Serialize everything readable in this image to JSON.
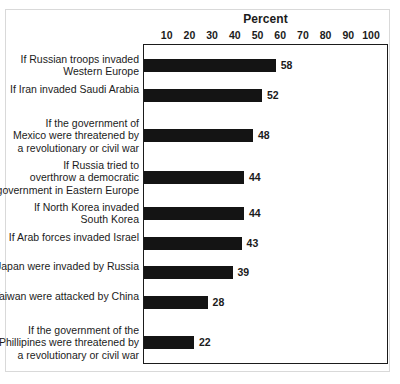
{
  "chart_data": {
    "type": "bar",
    "orientation": "horizontal",
    "title": "Percent",
    "xlabel": "Percent",
    "ylabel": "",
    "xlim": [
      0,
      100
    ],
    "xticks": [
      10,
      20,
      30,
      40,
      50,
      60,
      70,
      80,
      90,
      100
    ],
    "grid": false,
    "legend": null,
    "bar_color": "#141414",
    "categories": [
      "If Russian troops invaded\nWestern Europe",
      "If Iran invaded Saudi Arabia",
      "If the government of\nMexico were threatened by\na revolutionary or civil war",
      "If Russia tried to\noverthrow a democratic\ngovernment in Eastern Europe",
      "If North Korea invaded\nSouth Korea",
      "If Arab forces invaded Israel",
      "If Japan were invaded by Russia",
      "If Taiwan were attacked by China",
      "If the government of the\nPhillipines were threatened by\na revolutionary or civil war"
    ],
    "values": [
      58,
      52,
      48,
      44,
      44,
      43,
      39,
      28,
      22
    ],
    "value_labels": [
      "58",
      "52",
      "48",
      "44",
      "44",
      "43",
      "39",
      "28",
      "22"
    ]
  },
  "axis": {
    "tick_labels": [
      "10",
      "20",
      "30",
      "40",
      "50",
      "60",
      "70",
      "80",
      "90",
      "100"
    ]
  },
  "colors": {
    "bar": "#141414",
    "frame": "#1b1b1b",
    "outer_border": "#d9d9d9",
    "background": "#ffffff",
    "text": "#1b1b1b"
  }
}
